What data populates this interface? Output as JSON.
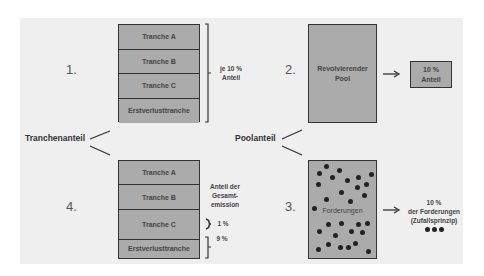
{
  "steps": {
    "step1": {
      "number": "1.",
      "tranches": [
        "Tranche A",
        "Tranche B",
        "Tranche C",
        "Erstverlusttranche"
      ],
      "bracket_label": "je 10 %\nAnteil"
    },
    "step2": {
      "number": "2.",
      "pool_label": "Revolvierender\nPool",
      "result_label": "10 %\nAnteil"
    },
    "step3": {
      "number": "3.",
      "pool_label": "Forderungen",
      "result_label": "10 %\nder Forderungen\n(Zufallsprinzip)"
    },
    "step4": {
      "number": "4.",
      "tranches": [
        "Tranche A",
        "Tranche B",
        "Tranche C",
        "Erstverlusttranche"
      ],
      "share_header": "Anteil der\nGesamt-\nemission",
      "tranche_c_share": "1 %",
      "first_loss_share": "9 %"
    }
  },
  "labels": {
    "left": "Tranchenanteil",
    "right": "Poolanteil"
  },
  "colors": {
    "panel_background": "#efefef",
    "box_fill": "#ababab",
    "box_border": "#333333",
    "dot": "#222222"
  }
}
